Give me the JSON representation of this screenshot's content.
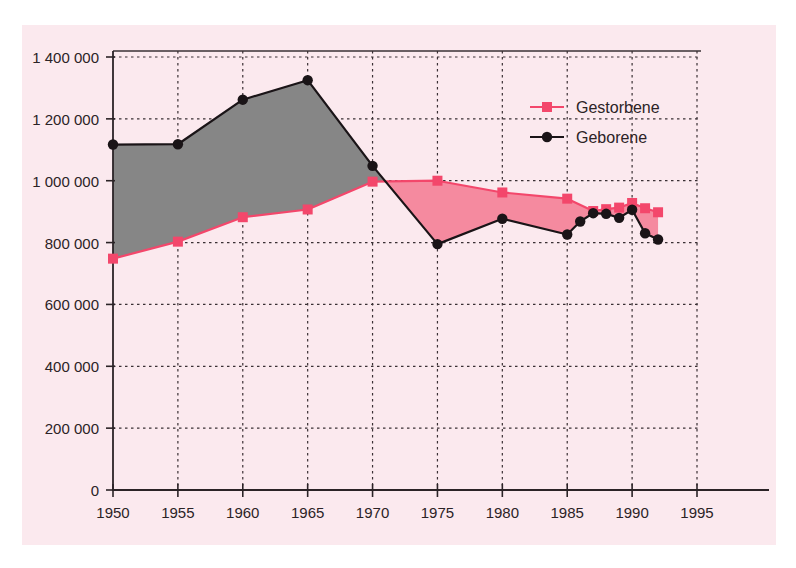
{
  "chart_data": {
    "type": "area",
    "title": "",
    "subtitle": "",
    "xlabel": "",
    "ylabel": "",
    "xlim": [
      1950,
      1995
    ],
    "ylim": [
      0,
      1400000
    ],
    "grid": true,
    "legend_position": "top-right",
    "x_ticks": [
      "1950",
      "1955",
      "1960",
      "1965",
      "1970",
      "1975",
      "1980",
      "1985",
      "1990",
      "1995"
    ],
    "x_tick_values": [
      1950,
      1955,
      1960,
      1965,
      1970,
      1975,
      1980,
      1985,
      1990,
      1995
    ],
    "y_ticks": [
      "0",
      "200 000",
      "400 000",
      "600 000",
      "800 000",
      "1 000 000",
      "1 200 000",
      "1 400 000"
    ],
    "y_tick_values": [
      0,
      200000,
      400000,
      600000,
      800000,
      1000000,
      1200000,
      1400000
    ],
    "series": [
      {
        "name": "Gestorbene",
        "color": "#f3476b",
        "marker": "square",
        "x": [
          1950,
          1955,
          1960,
          1965,
          1970,
          1975,
          1980,
          1985,
          1987,
          1988,
          1989,
          1990,
          1991,
          1992
        ],
        "values": [
          748000,
          803000,
          882000,
          907000,
          997000,
          1000000,
          962000,
          942000,
          902000,
          908000,
          913000,
          928000,
          911000,
          898000
        ]
      },
      {
        "name": "Geborene",
        "color": "#1a1417",
        "marker": "circle",
        "x": [
          1950,
          1955,
          1960,
          1965,
          1970,
          1975,
          1980,
          1985,
          1986,
          1987,
          1988,
          1989,
          1990,
          1991,
          1992
        ],
        "values": [
          1117000,
          1118000,
          1262000,
          1325000,
          1048000,
          795000,
          877000,
          826000,
          868000,
          895000,
          893000,
          880000,
          906000,
          830000,
          810000
        ]
      }
    ],
    "fill_regions": [
      {
        "name": "births-exceed-deaths",
        "color": "#868686",
        "from": 1950,
        "to": 1971
      },
      {
        "name": "deaths-exceed-births",
        "color": "#f58a9f",
        "from": 1971,
        "to": 1992
      }
    ]
  },
  "legend": {
    "items": [
      {
        "label": "Gestorbene",
        "color": "#f3476b",
        "marker": "square"
      },
      {
        "label": "Geborene",
        "color": "#1a1417",
        "marker": "circle"
      }
    ]
  }
}
